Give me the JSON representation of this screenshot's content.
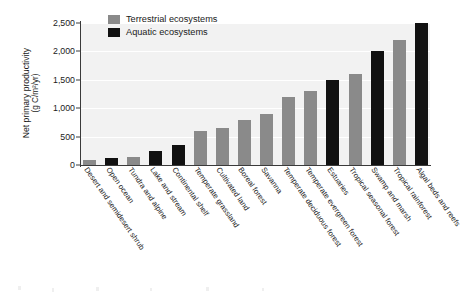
{
  "chart_data": {
    "type": "bar",
    "title": "",
    "xlabel": "",
    "ylabel": "Net primary productivity (g C/m²/yr)",
    "ylabel_line1": "Net primary productivity",
    "ylabel_line2": "(g C/m²/yr)",
    "ylim": [
      0,
      2500
    ],
    "ytick_values": [
      0,
      500,
      1000,
      1500,
      2000,
      2500
    ],
    "ytick_labels": [
      "0",
      "500",
      "1,000",
      "1,500",
      "2,000",
      "2,500"
    ],
    "grid": true,
    "grid_color": "#ffffff",
    "plot_background": "#f2f2f2",
    "legend_position": "top-left",
    "categories": [
      "Desert and semidesert shrub",
      "Open ocean",
      "Tundra and alpine",
      "Lake and stream",
      "Continental shelf",
      "Temperate grassland",
      "Cultivated land",
      "Boreal forest",
      "Savanna",
      "Temperate deciduous forest",
      "Temperate evergreen forest",
      "Estuaries",
      "Tropical seasonal forest",
      "Swamp and marsh",
      "Tropical rainforest",
      "Algal beds and reefs"
    ],
    "values": [
      90,
      125,
      140,
      250,
      360,
      600,
      700,
      800,
      900,
      1200,
      1300,
      1500,
      1600,
      2000,
      2200,
      2500
    ],
    "group_of_bar": [
      "terrestrial",
      "aquatic",
      "terrestrial",
      "aquatic",
      "aquatic",
      "terrestrial",
      "terrestrial",
      "terrestrial",
      "terrestrial",
      "terrestrial",
      "terrestrial",
      "aquatic",
      "terrestrial",
      "aquatic",
      "terrestrial",
      "aquatic"
    ],
    "bars": [
      {
        "label": "Desert and semidesert shrub",
        "value": 90,
        "group": "terrestrial"
      },
      {
        "label": "Open ocean",
        "value": 125,
        "group": "aquatic"
      },
      {
        "label": "Tundra and alpine",
        "value": 140,
        "group": "terrestrial"
      },
      {
        "label": "Lake and stream",
        "value": 250,
        "group": "aquatic"
      },
      {
        "label": "Continental shelf",
        "value": 360,
        "group": "aquatic"
      },
      {
        "label": "Temperate grassland",
        "value": 600,
        "group": "terrestrial"
      },
      {
        "label": "Cultivated land",
        "value": 650,
        "group": "terrestrial"
      },
      {
        "label": "Boreal forest",
        "value": 800,
        "group": "terrestrial"
      },
      {
        "label": "Savanna",
        "value": 900,
        "group": "terrestrial"
      },
      {
        "label": "Temperate deciduous forest",
        "value": 1200,
        "group": "terrestrial"
      },
      {
        "label": "Temperate evergreen forest",
        "value": 1300,
        "group": "terrestrial"
      },
      {
        "label": "Estuaries",
        "value": 1500,
        "group": "aquatic"
      },
      {
        "label": "Tropical seasonal forest",
        "value": 1600,
        "group": "terrestrial"
      },
      {
        "label": "Swamp and marsh",
        "value": 2000,
        "group": "aquatic"
      },
      {
        "label": "Tropical rainforest",
        "value": 2200,
        "group": "terrestrial"
      },
      {
        "label": "Algal beds and reefs",
        "value": 2500,
        "group": "aquatic"
      }
    ],
    "series": [
      {
        "name": "Terrestrial ecosystems",
        "color": "#8a8a8a"
      },
      {
        "name": "Aquatic ecosystems",
        "color": "#111111"
      }
    ]
  },
  "legend": {
    "items": [
      {
        "label": "Terrestrial ecosystems",
        "color": "#8a8a8a",
        "swatch_name": "terrestrial-swatch"
      },
      {
        "label": "Aquatic ecosystems",
        "color": "#111111",
        "swatch_name": "aquatic-swatch"
      }
    ]
  },
  "colors": {
    "terrestrial": "#8a8a8a",
    "aquatic": "#111111",
    "axis": "#3a3a3a",
    "gridline": "#ffffff",
    "plot_bg": "#f2f2f2",
    "page_bg": "#ffffff",
    "text": "#1a1a1a"
  }
}
